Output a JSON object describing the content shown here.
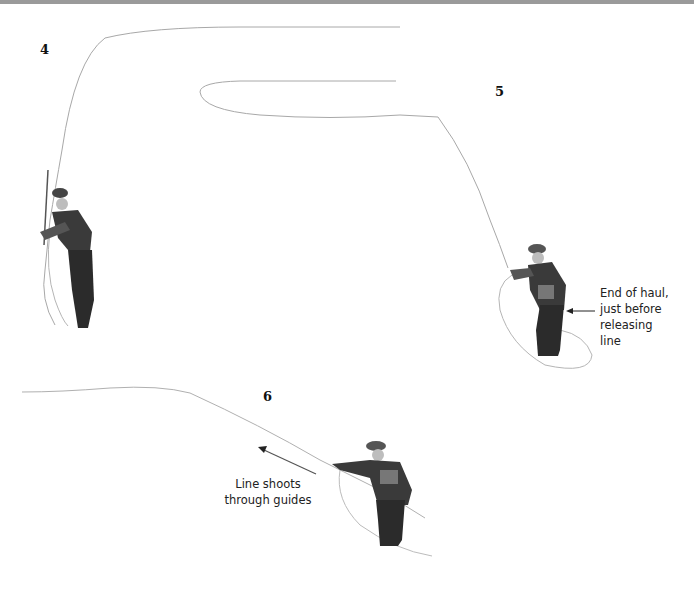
{
  "figure": {
    "steps": [
      {
        "number": "4",
        "caption": null
      },
      {
        "number": "5",
        "caption_lines": [
          "End of haul,",
          "just before",
          "releasing",
          "line"
        ]
      },
      {
        "number": "6",
        "caption_lines": [
          "Line shoots",
          "through guides"
        ]
      }
    ],
    "colors": {
      "background": "#ffffff",
      "line": "#9a9a9a",
      "figure_dark": "#2b2b2b",
      "text": "#222222",
      "top_bar": "#9a9a9a"
    }
  }
}
